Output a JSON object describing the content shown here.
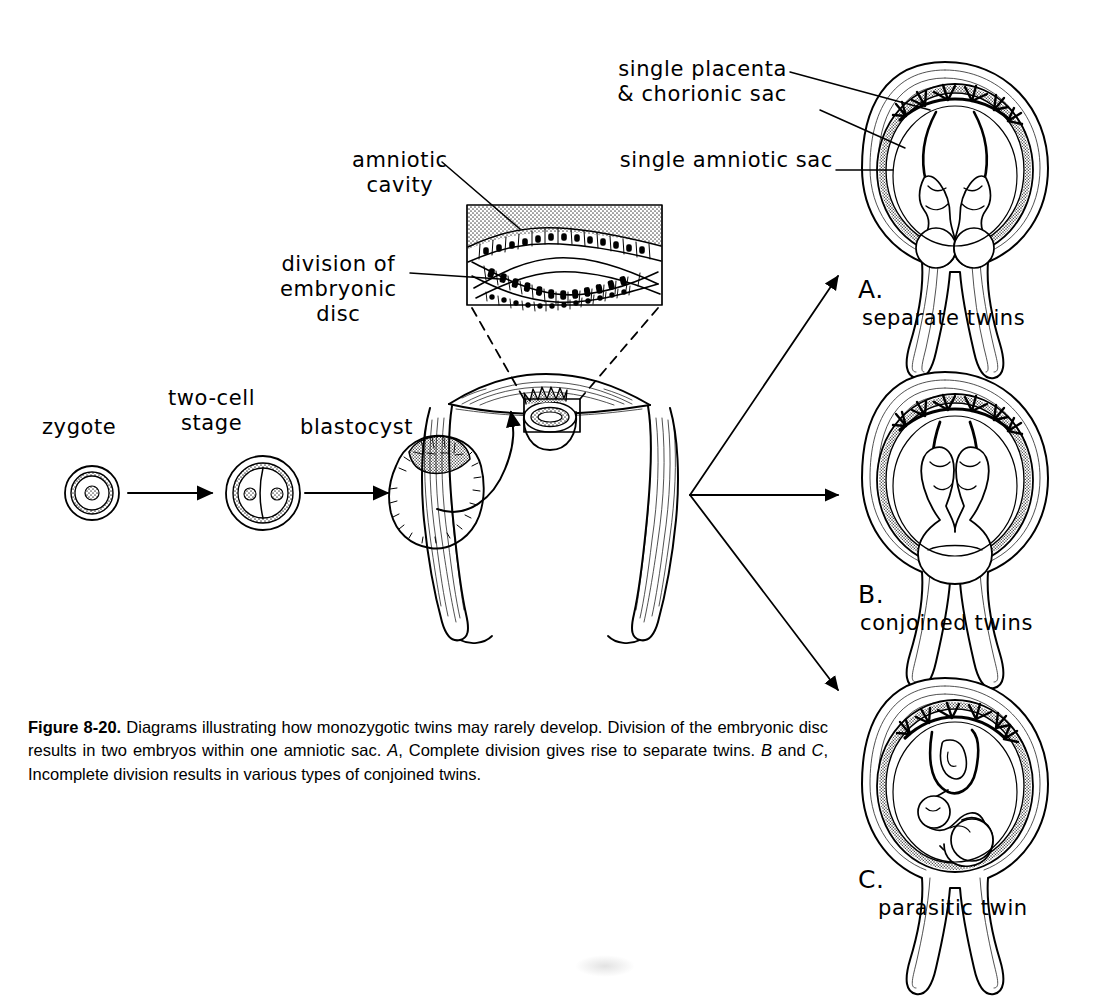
{
  "figure": {
    "number": "Figure 8-20.",
    "caption_rest": "  Diagrams illustrating how monozygotic twins may rarely develop. Division of the embryonic disc results in two embryos within one amniotic sac. ",
    "caption_a_letter": "A",
    "caption_a_text": ", Complete division gives rise to separate twins. ",
    "caption_b_letter": "B",
    "caption_b_join": " and ",
    "caption_c_letter": "C",
    "caption_c_text": ", Incomplete division results in various types of conjoined twins."
  },
  "stages": [
    {
      "label": "zygote",
      "x": 42,
      "y": 415
    },
    {
      "label": "two-cell\nstage",
      "x": 168,
      "y": 386
    },
    {
      "label": "blastocyst",
      "x": 300,
      "y": 415
    }
  ],
  "inset_labels": [
    {
      "label": "amniotic\ncavity",
      "x": 352,
      "y": 148
    },
    {
      "label": "division of\nembryonic\ndisc",
      "x": 280,
      "y": 252
    }
  ],
  "structure_labels": [
    {
      "label": "single placenta\n& chorionic sac",
      "x": 617,
      "y": 57
    },
    {
      "label": "single amniotic sac",
      "x": 617,
      "y": 148
    }
  ],
  "panels": [
    {
      "letter": "A.",
      "caption": "separate twins",
      "letter_x": 858,
      "letter_y": 275,
      "caption_x": 862,
      "caption_y": 306
    },
    {
      "letter": "B.",
      "caption": "conjoined twins",
      "letter_x": 858,
      "letter_y": 580,
      "caption_x": 860,
      "caption_y": 611
    },
    {
      "letter": "C.",
      "caption": "parasitic twin",
      "letter_x": 858,
      "letter_y": 865,
      "caption_x": 878,
      "caption_y": 896
    }
  ],
  "colors": {
    "ink": "#000000",
    "paper": "#ffffff",
    "stipple": "#7a7a7a",
    "shade": "#c9c9c9"
  }
}
